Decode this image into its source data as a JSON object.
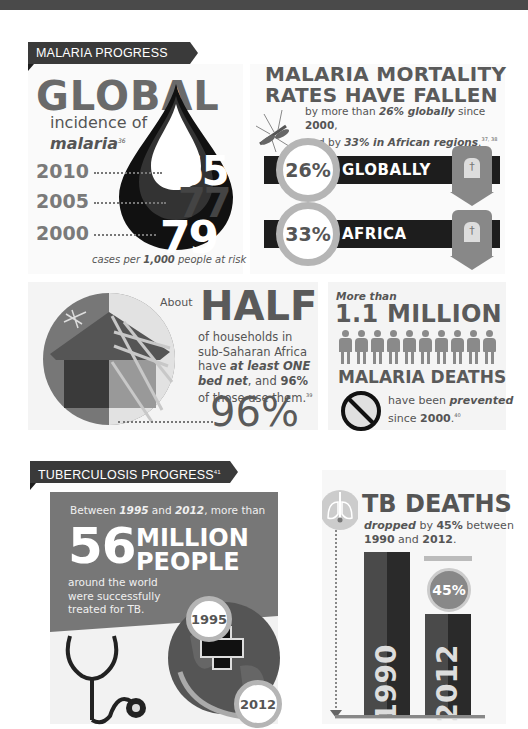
{
  "header_band": {
    "color": "#4a4a4a"
  },
  "malaria": {
    "section_label": "MALARIA PROGRESS",
    "global_incidence": {
      "title": "GLOBAL",
      "subtitle_line1": "incidence of",
      "subtitle_line2": "malaria",
      "footnote": "36",
      "rows": [
        {
          "year": "2010",
          "value": "65"
        },
        {
          "year": "2005",
          "value": "77"
        },
        {
          "year": "2000",
          "value": "79"
        }
      ],
      "caption_pre": "cases per ",
      "caption_bold": "1,000",
      "caption_post": " people at risk"
    },
    "mortality": {
      "title_line1": "MALARIA MORTALITY",
      "title_line2": "RATES HAVE FALLEN",
      "desc_1": "by more than ",
      "desc_2": "26% globally",
      "desc_3": " since ",
      "desc_4": "2000",
      "desc_5": ",",
      "desc_6": "and by ",
      "desc_7": "33% in African regions",
      "desc_8": ".",
      "footnote": "37, 38",
      "bands": [
        {
          "percent": "26%",
          "label": "GLOBALLY"
        },
        {
          "percent": "33%",
          "label": "AFRICA"
        }
      ]
    },
    "bednet": {
      "about": "About",
      "half": "HALF",
      "line1": "of households in",
      "line2": "sub-Saharan Africa",
      "line3_pre": "have ",
      "line3_bold": "at least ONE",
      "line4_bold": "bed net",
      "line4_mid": ", and ",
      "line4_pct": "96%",
      "line5": "of those use them.",
      "footnote": "39",
      "big_percent": "96%"
    },
    "prevented": {
      "more_than": "More than",
      "big": "1.1 MILLION",
      "people_count": 10,
      "deaths": "MALARIA DEATHS",
      "line1_pre": "have been ",
      "line1_bold": "prevented",
      "line2_pre": "since ",
      "line2_bold": "2000",
      "line2_post": ".",
      "footnote": "40"
    }
  },
  "tb": {
    "section_label": "TUBERCULOSIS PROGRESS",
    "section_footnote": "41",
    "treated": {
      "intro_1": "Between ",
      "intro_2": "1995",
      "intro_3": " and ",
      "intro_4": "2012",
      "intro_5": ", more than",
      "big_number": "56",
      "big_word1": "MILLION",
      "big_word2": "PEOPLE",
      "line1": "around the world",
      "line2": "were successfully",
      "line3": "treated for TB.",
      "year_start": "1995",
      "year_end": "2012"
    },
    "deaths": {
      "title": "TB DEATHS",
      "desc_1": "dropped",
      "desc_2": " by ",
      "desc_3": "45%",
      "desc_4": " between",
      "desc_5": "1990",
      "desc_6": " and ",
      "desc_7": "2012",
      "desc_8": ".",
      "drop_percent": "45%",
      "bar_1990": "1990",
      "bar_2012": "2012"
    }
  },
  "colors": {
    "dark": "#1d1d1d",
    "mid_gray": "#777777",
    "panel": "#f4f4f4",
    "text_gray": "#555555"
  },
  "chart_data": {
    "type": "bar",
    "title": "TB DEATHS",
    "categories": [
      "1990",
      "2012"
    ],
    "values": [
      100,
      55
    ],
    "ylabel": "Relative TB deaths (index)",
    "annotation": "45% drop"
  }
}
